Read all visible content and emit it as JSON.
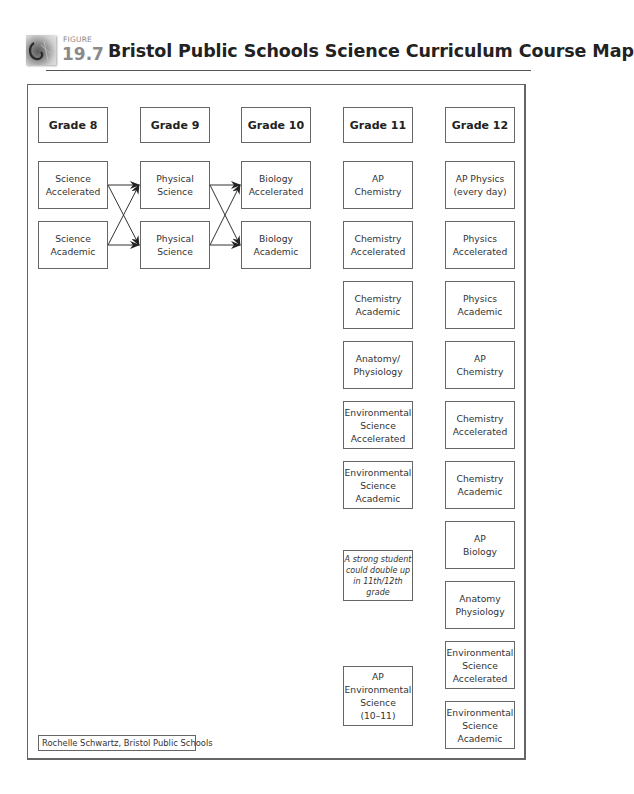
{
  "header": {
    "figure_label": "FIGURE",
    "figure_number": "19.7",
    "title": "Bristol Public Schools Science Curriculum Course Map"
  },
  "grades": [
    {
      "label": "Grade 8",
      "courses": [
        "Science\nAccelerated",
        "Science\nAcademic"
      ]
    },
    {
      "label": "Grade 9",
      "courses": [
        "Physical\nScience",
        "Physical\nScience"
      ]
    },
    {
      "label": "Grade 10",
      "courses": [
        "Biology\nAccelerated",
        "Biology\nAcademic"
      ]
    },
    {
      "label": "Grade 11",
      "courses": [
        "AP\nChemistry",
        "Chemistry\nAccelerated",
        "Chemistry\nAcademic",
        "Anatomy/\nPhysiology",
        "Environmental\nScience\nAccelerated",
        "Environmental\nScience\nAcademic",
        "AP\nEnvironmental\nScience\n(10–11)"
      ],
      "note": "A strong student\ncould double up\nin 11th/12th\ngrade"
    },
    {
      "label": "Grade 12",
      "courses": [
        "AP Physics\n(every day)",
        "Physics\nAccelerated",
        "Physics\nAcademic",
        "AP\nChemistry",
        "Chemistry\nAccelerated",
        "Chemistry\nAcademic",
        "AP\nBiology",
        "Anatomy\nPhysiology",
        "Environmental\nScience\nAccelerated",
        "Environmental\nScience\nAcademic"
      ]
    }
  ],
  "connections": [
    {
      "from": "Grade 8: Science Accelerated",
      "to": [
        "Grade 9: Physical Science (top)",
        "Grade 9: Physical Science (bottom)"
      ]
    },
    {
      "from": "Grade 8: Science Academic",
      "to": [
        "Grade 9: Physical Science (top)",
        "Grade 9: Physical Science (bottom)"
      ]
    },
    {
      "from": "Grade 9: Physical Science (top)",
      "to": [
        "Grade 10: Biology Accelerated",
        "Grade 10: Biology Academic"
      ]
    },
    {
      "from": "Grade 9: Physical Science (bottom)",
      "to": [
        "Grade 10: Biology Accelerated",
        "Grade 10: Biology Academic"
      ]
    }
  ],
  "credit": "Rochelle Schwartz, Bristol Public Schools",
  "colors": {
    "border": "#666666",
    "text": "#222222",
    "figure_number": "#8a8a8a"
  }
}
